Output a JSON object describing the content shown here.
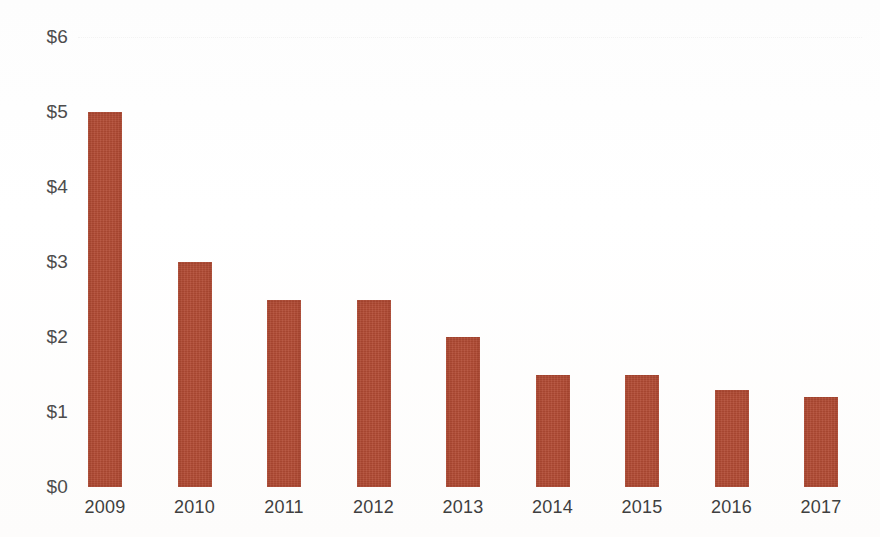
{
  "chart_data": {
    "type": "bar",
    "title": "",
    "subtitle": "",
    "xlabel": "",
    "ylabel": "",
    "categories": [
      "2009",
      "2010",
      "2011",
      "2012",
      "2013",
      "2014",
      "2015",
      "2016",
      "2017"
    ],
    "values": [
      5.0,
      3.0,
      2.5,
      2.5,
      2.0,
      1.5,
      1.5,
      1.3,
      1.2
    ],
    "ylim": [
      0,
      6
    ],
    "ytick_values": [
      0,
      1,
      2,
      3,
      4,
      5,
      6
    ],
    "ytick_labels": [
      "$0",
      "$1",
      "$2",
      "$3",
      "$4",
      "$5",
      "$6"
    ],
    "xtick_labels": [
      "2009",
      "2010",
      "2011",
      "2012",
      "2013",
      "2014",
      "2015",
      "2016",
      "2017"
    ],
    "grid": "faint-dotted-top-only",
    "gridline_values": [
      6
    ],
    "legend": null,
    "legend_position": "none",
    "annotations": [],
    "series": [
      {
        "name": "",
        "color": "#b24b34",
        "values": [
          5.0,
          3.0,
          2.5,
          2.5,
          2.0,
          1.5,
          1.5,
          1.3,
          1.2
        ]
      }
    ],
    "colors": {
      "bar": "#b24b34",
      "axis_text": "#4c4c4c",
      "gridline": "#f2f2f2",
      "background": "#fefefe"
    }
  },
  "layout": {
    "plot_left": 88,
    "plot_right": 840,
    "baseline_y": 487,
    "top_y": 37,
    "px_per_unit": 75,
    "bar_width": 34,
    "bar_pitch": 89.5,
    "x_label_y": 497
  }
}
